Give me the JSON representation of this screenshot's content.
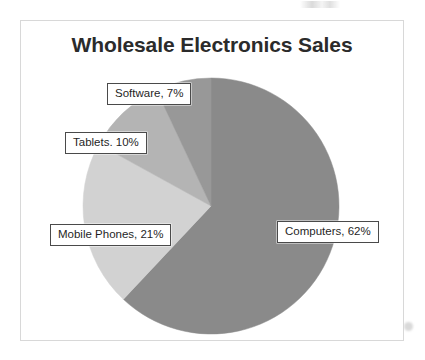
{
  "chart_data": {
    "type": "pie",
    "title": "Wholesale Electronics Sales",
    "xlabel": "",
    "ylabel": "",
    "legend": "none",
    "grid": false,
    "data_labels": [
      "Computers, 62%",
      "Mobile Phones, 21%",
      "Tablets. 10%",
      "Software, 7%"
    ],
    "categories": [
      "Computers",
      "Mobile Phones",
      "Tablets",
      "Software"
    ],
    "values": [
      62,
      21,
      10,
      7
    ],
    "units": "%",
    "start_angle_deg": 0,
    "direction": "clockwise",
    "slices": [
      {
        "label": "Computers",
        "value": 62,
        "value_text": "62%",
        "data_label": "Computers, 62%",
        "color": "#8a8a8a",
        "start_deg": 0,
        "end_deg": 223.2
      },
      {
        "label": "Mobile Phones",
        "value": 21,
        "value_text": "21%",
        "data_label": "Mobile Phones, 21%",
        "color": "#d2d2d2",
        "start_deg": 223.2,
        "end_deg": 298.8
      },
      {
        "label": "Tablets",
        "value": 10,
        "value_text": "10%",
        "data_label": "Tablets. 10%",
        "color": "#b4b4b4",
        "start_deg": 298.8,
        "end_deg": 334.8
      },
      {
        "label": "Software",
        "value": 7,
        "value_text": "7%",
        "data_label": "Software, 7%",
        "color": "#989898",
        "start_deg": 334.8,
        "end_deg": 360
      }
    ]
  },
  "chart": {
    "title": "Wholesale Electronics Sales",
    "border_color": "#d8d8d8",
    "background": "#ffffff",
    "title_color": "#2b2b2b",
    "label_border_color": "#4a4a4a",
    "label_text_color": "#1f1f1f"
  }
}
